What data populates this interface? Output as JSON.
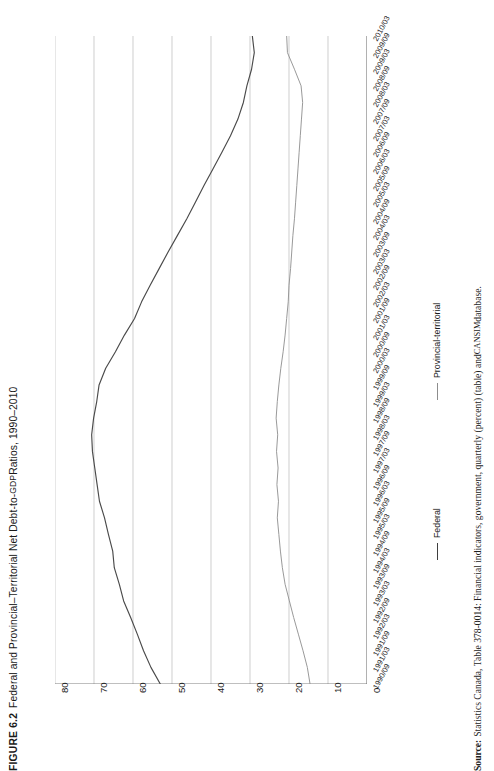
{
  "figure": {
    "number": "FIGURE 6.2",
    "title_main": "Federal and Provincial–Territorial Net Debt-to-",
    "title_smallcaps": "GDP",
    "title_tail": " Ratios, 1990–2010",
    "title_full": "FIGURE 6.2 Federal and Provincial–Territorial Net Debt-to-GDP Ratios, 1990–2010"
  },
  "source": {
    "label": "Source:",
    "text_a": " Statistics Canada, Table 378-0014: Financial indicators, government, quarterly (percent) (table) and ",
    "text_smallcaps": "CANSIM",
    "text_b": " database.",
    "full": "Source: Statistics Canada, Table 378-0014: Financial indicators, government, quarterly (percent) (table) and CANSIM database."
  },
  "legend": {
    "entries": [
      {
        "label": "Federal",
        "color": "#3f3f3f"
      },
      {
        "label": "Provincial-territorial",
        "color": "#8d8d8d"
      }
    ]
  },
  "colors": {
    "federal_line": "#4a4a4a",
    "provincial_line": "#949494",
    "gridline": "#b9b9b9",
    "axis": "#6f6f6f",
    "text": "#1a1a1a",
    "background": "#ffffff"
  },
  "chart_data": {
    "type": "line",
    "orientation": "rotated-90-ccw",
    "xlabel": "",
    "ylabel": "Net debt-to-GDP ratio (percent)",
    "ylim": [
      0,
      80
    ],
    "y_ticks": [
      80,
      70,
      60,
      50,
      40,
      30,
      20,
      10,
      0
    ],
    "grid": true,
    "legend_position": "right",
    "categories": [
      "1990/09",
      "1991/03",
      "1991/09",
      "1992/03",
      "1992/09",
      "1993/03",
      "1993/09",
      "1994/03",
      "1994/09",
      "1995/03",
      "1995/09",
      "1996/03",
      "1996/09",
      "1997/03",
      "1997/09",
      "1998/03",
      "1998/09",
      "1999/03",
      "1999/09",
      "2000/03",
      "2000/09",
      "2001/03",
      "2001/09",
      "2002/03",
      "2002/09",
      "2003/03",
      "2003/09",
      "2004/03",
      "2004/09",
      "2005/03",
      "2005/09",
      "2006/03",
      "2006/09",
      "2007/03",
      "2007/09",
      "2008/03",
      "2008/09",
      "2009/03",
      "2009/09",
      "2010/03"
    ],
    "series": [
      {
        "name": "Federal",
        "color": "#4a4a4a",
        "values": [
          53.0,
          55.4,
          57.3,
          58.9,
          60.6,
          62.4,
          63.5,
          64.8,
          65.2,
          66.3,
          67.3,
          68.6,
          69.2,
          69.8,
          70.4,
          70.6,
          70.1,
          69.3,
          68.7,
          67.0,
          64.5,
          62.2,
          59.6,
          57.8,
          55.6,
          53.3,
          51.0,
          48.6,
          46.2,
          44.0,
          41.8,
          39.5,
          37.2,
          35.0,
          33.1,
          31.7,
          30.8,
          29.6,
          28.9,
          29.4
        ]
      },
      {
        "name": "Provincial-territorial",
        "color": "#949494",
        "values": [
          14.6,
          15.3,
          16.4,
          17.6,
          18.8,
          19.9,
          21.0,
          21.7,
          22.2,
          22.6,
          23.0,
          22.7,
          23.1,
          22.8,
          23.2,
          22.9,
          23.3,
          23.0,
          22.6,
          22.1,
          21.5,
          21.0,
          20.6,
          20.2,
          20.0,
          19.6,
          19.3,
          19.0,
          18.6,
          18.3,
          18.0,
          17.7,
          17.4,
          17.1,
          16.8,
          16.5,
          16.9,
          18.6,
          20.4,
          20.6
        ]
      }
    ],
    "annotations": [
      "Federal ratio peaks near 70 percent around 1997/09–1998/03 then declines steadily.",
      "Provincial-territorial ratio stays between roughly 15 and 23 percent over the period."
    ]
  }
}
